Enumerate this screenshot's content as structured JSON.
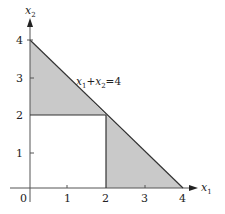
{
  "figure": {
    "type": "feasible-region-diagram",
    "x_axis": {
      "label": "x",
      "subscript": "1",
      "ticks": [
        "0",
        "1",
        "2",
        "3",
        "4"
      ]
    },
    "y_axis": {
      "label": "x",
      "subscript": "2",
      "ticks": [
        "1",
        "2",
        "3",
        "4"
      ]
    },
    "constraint_label": {
      "x1": "x",
      "s1": "1",
      "plus": "+",
      "x2": "x",
      "s2": "2",
      "eq": "=",
      "rhs": "4"
    },
    "regions": [
      {
        "name": "upper-left-triangle",
        "vertices": [
          [
            0,
            2
          ],
          [
            0,
            4
          ],
          [
            2,
            2
          ]
        ]
      },
      {
        "name": "lower-right-triangle",
        "vertices": [
          [
            2,
            0
          ],
          [
            2,
            2
          ],
          [
            4,
            0
          ]
        ]
      }
    ],
    "lines": [
      {
        "name": "x1+x2=4",
        "from": [
          0,
          4
        ],
        "to": [
          4,
          0
        ]
      },
      {
        "name": "x2=2",
        "from": [
          0,
          2
        ],
        "to": [
          2,
          2
        ]
      },
      {
        "name": "x1=2",
        "from": [
          2,
          0
        ],
        "to": [
          2,
          2
        ]
      }
    ],
    "colors": {
      "shade": "#c8c8c8",
      "line": "#333333",
      "axis": "#555555"
    }
  }
}
